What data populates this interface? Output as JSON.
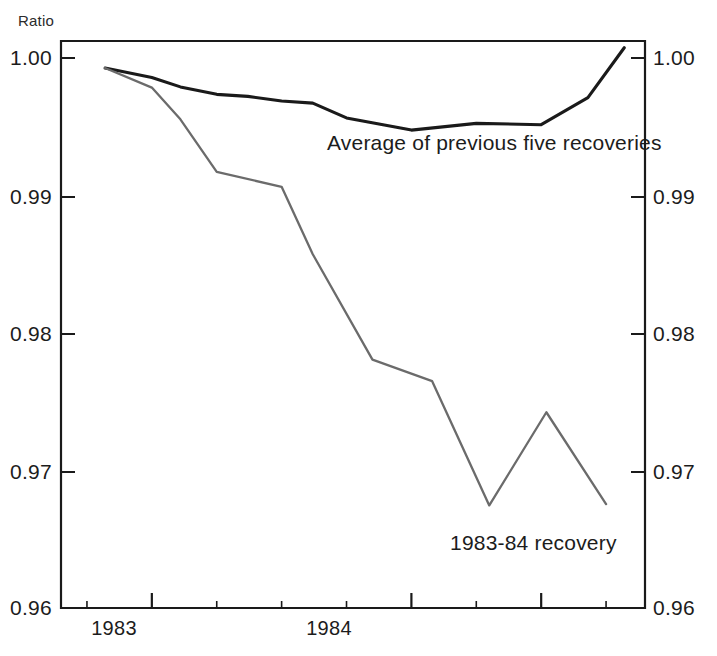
{
  "chart_data": {
    "type": "line",
    "title": "",
    "subtitle": "",
    "ylabel": "Ratio",
    "xlabel": "",
    "ylim": [
      0.96,
      1.002
    ],
    "yticks": [
      0.96,
      0.97,
      0.98,
      0.99,
      1.0
    ],
    "ytick_labels": [
      "0.96",
      "0.97",
      "0.98",
      "0.99",
      "1.00"
    ],
    "ytick_labels_right": [
      "0.96",
      "0.97",
      "0.98",
      "0.99",
      "1.00"
    ],
    "xticks_major": [
      "1983",
      "1984"
    ],
    "xtick_labels": [
      "1983",
      "1984"
    ],
    "x_major_positions": [
      1983.0,
      1984.0
    ],
    "x_minor_count": 15,
    "xlim": [
      1982.65,
      1984.9
    ],
    "grid": false,
    "legend_position": "inline-annotation",
    "series": [
      {
        "name": "Average of previous five recoveries",
        "color": "#1a1a1a",
        "width": 3.1,
        "x": [
          1982.82,
          1983.0,
          1983.11,
          1983.25,
          1983.37,
          1983.5,
          1983.62,
          1983.75,
          1984.0,
          1984.25,
          1984.5,
          1984.68,
          1984.82
        ],
        "values": [
          1.0,
          0.9993,
          0.9986,
          0.99805,
          0.9979,
          0.99755,
          0.9974,
          0.9963,
          0.9954,
          0.9959,
          0.9958,
          0.9978,
          1.0015
        ]
      },
      {
        "name": "1983-84 recovery",
        "color": "#6b6b6b",
        "width": 2.3,
        "x": [
          1982.82,
          1983.0,
          1983.11,
          1983.25,
          1983.5,
          1983.62,
          1983.85,
          1984.08,
          1984.3,
          1984.52,
          1984.75
        ],
        "values": [
          1.0,
          0.99855,
          0.9962,
          0.9923,
          0.9912,
          0.9862,
          0.9784,
          0.9768,
          0.9676,
          0.9745,
          0.9677
        ]
      }
    ],
    "annotations": [
      {
        "name": "average-line-label",
        "text": "Average of previous five recoveries"
      },
      {
        "name": "recovery-line-label",
        "text": "1983-84 recovery"
      }
    ]
  },
  "axis": {
    "unit_label": "Ratio",
    "left_tick_labels": [
      "1.00",
      "0.99",
      "0.98",
      "0.97",
      "0.96"
    ],
    "right_tick_labels": [
      "1.00",
      "0.99",
      "0.98",
      "0.97",
      "0.96"
    ],
    "x_labels": [
      "1983",
      "1984"
    ]
  },
  "labels": {
    "average_series": "Average of previous five recoveries",
    "recovery_series": "1983-84 recovery"
  },
  "colors": {
    "average_line": "#1a1a1a",
    "recovery_line": "#6b6b6b",
    "axis": "#1a1a1a",
    "background": "#ffffff",
    "text": "#1c1c1c"
  }
}
